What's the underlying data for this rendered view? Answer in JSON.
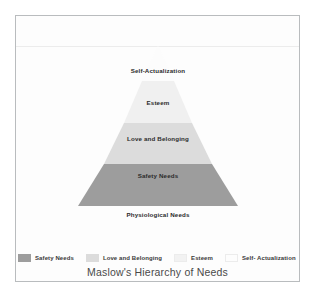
{
  "chart_data": {
    "type": "pie",
    "title": "Maslow's Hierarchy of Needs",
    "xlabel": "",
    "ylabel": "",
    "legend_position": "bottom",
    "grid": false,
    "categories": [
      "Physiological Needs",
      "Safety Needs",
      "Love and Belonging",
      "Esteem",
      "Self-Actualization"
    ],
    "values": [
      5,
      4,
      3,
      2,
      1
    ],
    "tiers": [
      {
        "label": "Self-Actualization",
        "level": 5,
        "color": "#fcfcfc",
        "label_x": 158,
        "label_y": 70,
        "label_inside": false
      },
      {
        "label": "Esteem",
        "level": 4,
        "color": "#f0f0f0",
        "label_x": 158,
        "label_y": 102,
        "label_inside": true
      },
      {
        "label": "Love and Belonging",
        "level": 3,
        "color": "#dcdcdc",
        "label_x": 158,
        "label_y": 138,
        "label_inside": true
      },
      {
        "label": "Safety Needs",
        "level": 2,
        "color": "#9d9d9d",
        "label_x": 158,
        "label_y": 175,
        "label_inside": true
      },
      {
        "label": "Physiological Needs",
        "level": 1,
        "color": "#ffffff",
        "label_x": 158,
        "label_y": 214,
        "label_inside": false
      }
    ]
  },
  "legend": {
    "items": [
      {
        "label": "Safety Needs",
        "color": "#9d9d9d"
      },
      {
        "label": "Love and Belonging",
        "color": "#dcdcdc"
      },
      {
        "label": "Esteem",
        "color": "#f2f2f2"
      },
      {
        "label": "Self- Actualization",
        "color": "#fdfdfd"
      }
    ]
  },
  "title": {
    "text": "Maslow's Hierarchy of Needs"
  },
  "colors": {
    "frame_border": "#b9bcbe",
    "background": "#ffffff",
    "figure_background": "#fdfdfd",
    "label_text": "#2b2b2b",
    "title_text": "#4a4a4a"
  }
}
